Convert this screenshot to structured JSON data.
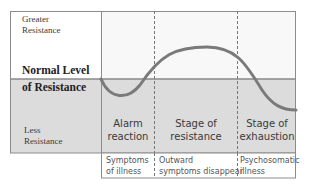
{
  "diagram": {
    "y_labels": {
      "greater": [
        "Greater",
        "Resistance"
      ],
      "normal": [
        "Normal Level",
        "of Resistance"
      ],
      "less": [
        "Less",
        "Resistance"
      ]
    },
    "stages": [
      {
        "line1": "Alarm",
        "line2": "reaction",
        "symptoms": [
          "Symptoms",
          "of illness"
        ]
      },
      {
        "line1": "Stage of",
        "line2": "resistance",
        "symptoms": [
          "Outward",
          "symptoms disappear"
        ]
      },
      {
        "line1": "Stage of",
        "line2": "exhaustion",
        "symptoms": [
          "Psychosomatic",
          "illness"
        ]
      }
    ],
    "colors": {
      "shaded": "#dcdcdc",
      "upper": "#f7f7f7",
      "curve": "#7a7a7a",
      "frame": "#8c8c8c",
      "normal_line": "#8a8a8a"
    }
  }
}
